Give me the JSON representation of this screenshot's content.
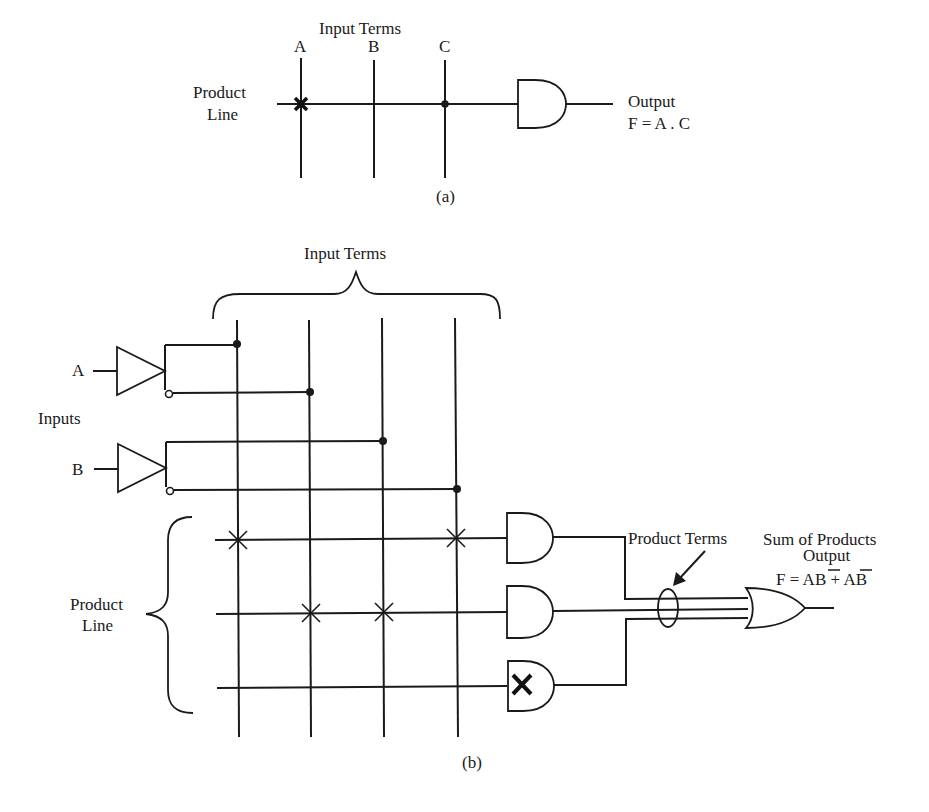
{
  "part_a": {
    "caption": "(a)",
    "input_terms_label": "Input  Terms",
    "inputs": [
      "A",
      "B",
      "C"
    ],
    "product_line_label": [
      "Product",
      "Line"
    ],
    "connections": {
      "A": "fused-x",
      "B": "none",
      "C": "dot"
    },
    "gate": "AND",
    "output_label": "Output",
    "output_expr": "F = A . C"
  },
  "part_b": {
    "caption": "(b)",
    "input_terms_label": "Input Terms",
    "inputs_label": "Inputs",
    "inputs": [
      "A",
      "B"
    ],
    "input_term_columns": [
      "A",
      "A'",
      "B",
      "B'"
    ],
    "product_line_label": [
      "Product",
      "Line"
    ],
    "product_lines": [
      {
        "crosses": [
          0,
          3
        ],
        "gate": "AND",
        "disabled": false
      },
      {
        "crosses": [
          1,
          2
        ],
        "gate": "AND",
        "disabled": false
      },
      {
        "crosses": [],
        "gate": "AND",
        "disabled": true
      }
    ],
    "product_terms_label": "Product Terms",
    "sum_label": "Sum of Products",
    "output_label": "Output",
    "output_expr_prefix": "F = A",
    "output_expr_bbar": "B",
    "output_expr_plus": " + ",
    "output_expr_abar": "A",
    "output_expr_suffix": "B",
    "output_gate": "OR"
  },
  "colors": {
    "ink": "#1a1a1a",
    "background": "#ffffff"
  }
}
